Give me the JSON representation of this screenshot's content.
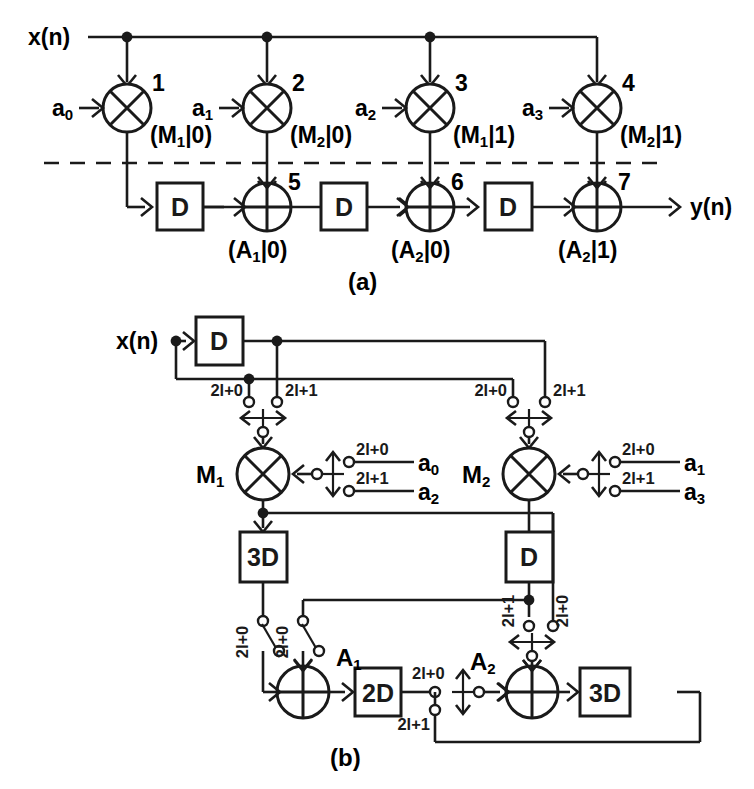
{
  "figure": {
    "caption_a": "(a)",
    "caption_b": "(b)",
    "stroke_color": "#1a1a1a",
    "background_color": "#ffffff"
  },
  "panel_a": {
    "input_label": "x(n)",
    "output_label": "y(n)",
    "multipliers": [
      {
        "id": "1",
        "coefficient": "a",
        "coefficient_sub": "0",
        "folding_set": "(M",
        "folding_sub": "1",
        "folding_tail": "|0)"
      },
      {
        "id": "2",
        "coefficient": "a",
        "coefficient_sub": "1",
        "folding_set": "(M",
        "folding_sub": "2",
        "folding_tail": "|0)"
      },
      {
        "id": "3",
        "coefficient": "a",
        "coefficient_sub": "2",
        "folding_set": "(M",
        "folding_sub": "1",
        "folding_tail": "|1)"
      },
      {
        "id": "4",
        "coefficient": "a",
        "coefficient_sub": "3",
        "folding_set": "(M",
        "folding_sub": "2",
        "folding_tail": "|1)"
      }
    ],
    "adders": [
      {
        "id": "5",
        "folding_set": "(A",
        "folding_sub": "1",
        "folding_tail": "|0)"
      },
      {
        "id": "6",
        "folding_set": "(A",
        "folding_sub": "2",
        "folding_tail": "|0)"
      },
      {
        "id": "7",
        "folding_set": "(A",
        "folding_sub": "2",
        "folding_tail": "|1)"
      }
    ],
    "delays": [
      {
        "label": "D"
      },
      {
        "label": "D"
      },
      {
        "label": "D"
      }
    ]
  },
  "panel_b": {
    "input_label": "x(n)",
    "input_delay": "D",
    "multipliers": [
      {
        "name": "M",
        "name_sub": "1"
      },
      {
        "name": "M",
        "name_sub": "2"
      }
    ],
    "adders": [
      {
        "name": "A",
        "name_sub": "1"
      },
      {
        "name": "A",
        "name_sub": "2"
      }
    ],
    "delay_boxes": [
      {
        "label": "3D"
      },
      {
        "label": "D"
      },
      {
        "label": "2D"
      },
      {
        "label": "3D"
      }
    ],
    "switch_labels": {
      "even": "2l+0",
      "odd": "2l+1"
    },
    "input_switch_left": {
      "even": "2l+0",
      "odd": "2l+1"
    },
    "input_switch_right": {
      "even": "2l+0",
      "odd": "2l+1"
    },
    "coefficients_m1": [
      {
        "phase": "2l+0",
        "name": "a",
        "name_sub": "0"
      },
      {
        "phase": "2l+1",
        "name": "a",
        "name_sub": "2"
      }
    ],
    "coefficients_m2": [
      {
        "phase": "2l+0",
        "name": "a",
        "name_sub": "1"
      },
      {
        "phase": "2l+1",
        "name": "a",
        "name_sub": "3"
      }
    ],
    "a1_switch_labels": [
      "2l+0",
      "2l+0"
    ],
    "a2_switch_labels": [
      "2l+1",
      "2l+0"
    ],
    "out2d_labels": [
      "2l+0",
      "2l+1"
    ]
  }
}
